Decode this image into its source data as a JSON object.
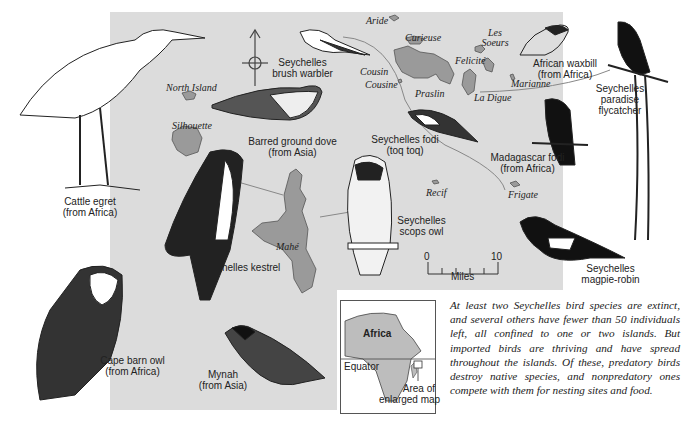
{
  "figure": {
    "type": "illustrated map",
    "map_background_color": "#dcdcdc"
  },
  "islands": [
    {
      "name": "Aride"
    },
    {
      "name": "Curieuse"
    },
    {
      "name": "Les Soeurs"
    },
    {
      "name": "Felicité"
    },
    {
      "name": "Marianne"
    },
    {
      "name": "La Digue"
    },
    {
      "name": "Praslin"
    },
    {
      "name": "Cousin"
    },
    {
      "name": "Cousine"
    },
    {
      "name": "North Island"
    },
    {
      "name": "Silhouette"
    },
    {
      "name": "Mahé"
    },
    {
      "name": "Recif"
    },
    {
      "name": "Frigate"
    }
  ],
  "birds": [
    {
      "name": "Cattle egret",
      "origin": "(from Africa)"
    },
    {
      "name": "Seychelles brush warbler",
      "line1": "Seychelles",
      "line2": "brush warbler"
    },
    {
      "name": "Barred ground dove",
      "origin": "(from Asia)"
    },
    {
      "name": "Seychelles fodi",
      "origin": "(toq toq)"
    },
    {
      "name": "African waxbill",
      "origin": "(from Africa)"
    },
    {
      "name": "Seychelles paradise flycatcher",
      "line1": "Seychelles",
      "line2": "paradise",
      "line3": "flycatcher"
    },
    {
      "name": "Madagascar fodi",
      "origin": "(from Africa)"
    },
    {
      "name": "Seychelles kestrel"
    },
    {
      "name": "Seychelles scops owl",
      "line1": "Seychelles",
      "line2": "scops owl"
    },
    {
      "name": "Seychelles magpie-robin",
      "line1": "Seychelles",
      "line2": "magpie-robin"
    },
    {
      "name": "Cape barn owl",
      "origin": "(from Africa)"
    },
    {
      "name": "Mynah",
      "origin": "(from Asia)"
    }
  ],
  "scale_bar": {
    "min": "0",
    "max": "10",
    "unit": "Miles"
  },
  "inset_map": {
    "continent": "Africa",
    "equator_label": "Equator",
    "area_label_line1": "Area of",
    "area_label_line2": "enlarged map"
  },
  "caption": "At least two Seychelles bird species are extinct, and several others have fewer than 50 individuals left, all confined to one or two islands. But imported birds are thriving and have spread throughout the islands. Of these, predatory birds destroy native species, and nonpredatory ones compete with them for nesting sites and food."
}
